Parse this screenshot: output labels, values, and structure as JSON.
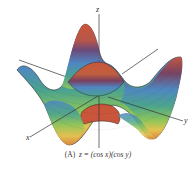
{
  "figure": {
    "panel_label": "(A)",
    "equation": "z = (cos x)(cos y)",
    "axes": {
      "x": "x",
      "y": "y",
      "z": "z"
    },
    "surface_function": "cos(x)*cos(y)",
    "colormap": [
      "#c9553a",
      "#d9883f",
      "#e3c351",
      "#8cc55a",
      "#4aa38f",
      "#4f86c4",
      "#5a5a9a",
      "#8a3f5a"
    ]
  }
}
